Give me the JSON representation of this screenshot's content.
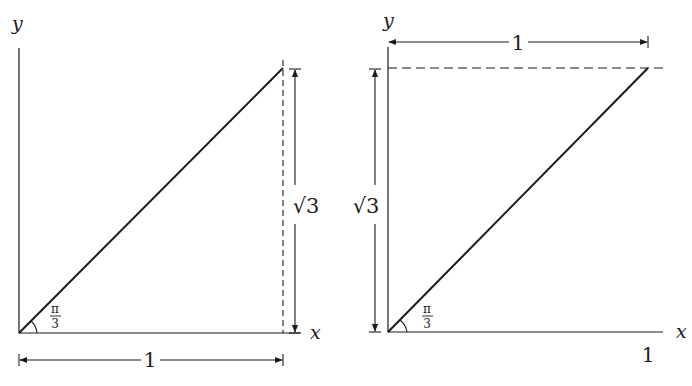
{
  "figures": [
    {
      "id": "left",
      "axis_x_label": "x",
      "axis_y_label": "y",
      "angle_label_num": "π",
      "angle_label_den": "3",
      "vertical_dim_label": "√3",
      "horizontal_dim_label": "1"
    },
    {
      "id": "right",
      "axis_x_label": "x",
      "axis_y_label": "y",
      "angle_label_num": "π",
      "angle_label_den": "3",
      "vertical_dim_label": "√3",
      "horizontal_dim_label": "1",
      "x_tick_label": "1"
    }
  ],
  "colors": {
    "ink": "#1a1a1a",
    "background": "#ffffff"
  }
}
